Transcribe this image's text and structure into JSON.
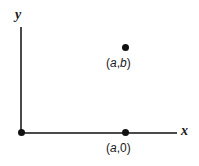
{
  "figure": {
    "background_color": "#ffffff",
    "axis_color": "#4a4a4a",
    "point_color": "#111111",
    "text_color": "#1a1a1a",
    "axes": {
      "y_label": "y",
      "x_label": "x"
    },
    "points": [
      {
        "name": "origin",
        "label": "",
        "x": 21,
        "y": 133
      },
      {
        "name": "point-ab",
        "label": "(a,b)",
        "label_open": "(",
        "label_var1": "a",
        "label_comma": ",",
        "label_var2": "b",
        "label_close": ")",
        "x": 125,
        "y": 48
      },
      {
        "name": "point-a0",
        "label": "(a,0)",
        "label_open": "(",
        "label_var1": "a",
        "label_comma": ",",
        "label_var2": "0",
        "label_close": ")",
        "x": 125,
        "y": 133
      }
    ]
  },
  "chart_data": {
    "type": "scatter",
    "title": "",
    "xlabel": "x",
    "ylabel": "y",
    "grid": false,
    "legend": false,
    "annotations": [
      "(a,b)",
      "(a,0)"
    ],
    "series": [
      {
        "name": "plotted-points",
        "points": [
          {
            "label": "(a,0)",
            "x": "a",
            "y": 0
          },
          {
            "label": "(a,b)",
            "x": "a",
            "y": "b"
          }
        ]
      }
    ]
  }
}
